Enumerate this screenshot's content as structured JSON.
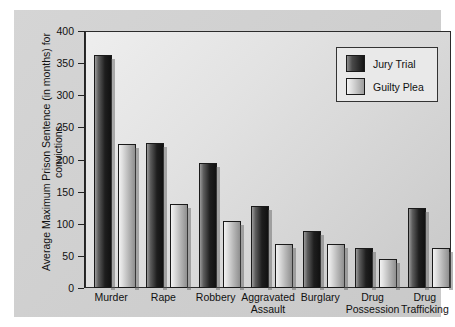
{
  "chart_data": {
    "type": "bar",
    "title": "",
    "xlabel": "",
    "ylabel": "Average Maximum Prison Sentence (in months) for convictions",
    "ylim": [
      0,
      400
    ],
    "yticks": [
      0,
      50,
      100,
      150,
      200,
      250,
      300,
      350,
      400
    ],
    "ytick_labels": [
      "0",
      "50",
      "100",
      "150",
      "200",
      "250",
      "300",
      "350",
      "400"
    ],
    "grid": false,
    "legend_position": "top-right",
    "categories": [
      "Murder",
      "Rape",
      "Robbery",
      "Aggravated\nAssault",
      "Burglary",
      "Drug\nPossession",
      "Drug\nTrafficking"
    ],
    "series": [
      {
        "name": "Jury Trial",
        "color": "#141414",
        "values": [
          363,
          225,
          194,
          127,
          89,
          63,
          125
        ]
      },
      {
        "name": "Guilty Plea",
        "color": "#c8c8c8",
        "values": [
          224,
          131,
          105,
          69,
          68,
          45,
          62
        ]
      }
    ]
  },
  "legend": {
    "items": [
      {
        "label": "Jury Trial"
      },
      {
        "label": "Guilty Plea"
      }
    ]
  },
  "axis": {
    "y_title": "Average Maximum Prison Sentence (in months) for convictions"
  }
}
